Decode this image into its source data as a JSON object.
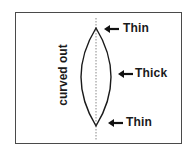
{
  "diagram": {
    "side_label": "curved out",
    "callouts": [
      {
        "label": "Thin",
        "position": "top"
      },
      {
        "label": "Thick",
        "position": "middle"
      },
      {
        "label": "Thin",
        "position": "bottom"
      }
    ],
    "colors": {
      "stroke": "#1a1a1a",
      "frame": "#4a4a4a",
      "axis": "#888888",
      "background": "#ffffff"
    }
  }
}
